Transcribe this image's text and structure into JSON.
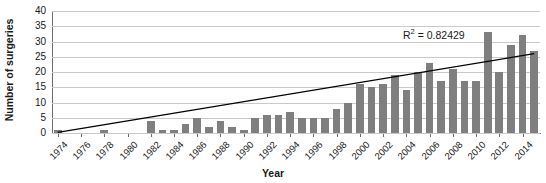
{
  "chart_data": {
    "type": "bar",
    "title": "",
    "xlabel": "Year",
    "ylabel": "Number of surgeries",
    "ylim": [
      0,
      40
    ],
    "ytick_values": [
      0,
      5,
      10,
      15,
      20,
      25,
      30,
      35,
      40
    ],
    "ytick_labels": [
      "0",
      "5",
      "10",
      "15",
      "20",
      "25",
      "30",
      "35",
      "40"
    ],
    "grid": true,
    "legend": "none",
    "bar_color": "#7f7f7f",
    "trendline": {
      "type": "linear",
      "color": "#000000",
      "annotation": "R² = 0.82429",
      "annotation_prefix": "R",
      "annotation_sup": "2",
      "annotation_suffix": " = 0.82429",
      "r_squared": 0.82429,
      "y_start": 0.2,
      "y_end": 26.0
    },
    "categories": [
      "1974",
      "1975",
      "1976",
      "1977",
      "1978",
      "1979",
      "1980",
      "1981",
      "1982",
      "1983",
      "1984",
      "1985",
      "1986",
      "1987",
      "1988",
      "1989",
      "1990",
      "1991",
      "1992",
      "1993",
      "1994",
      "1995",
      "1996",
      "1997",
      "1998",
      "1999",
      "2000",
      "2001",
      "2002",
      "2003",
      "2004",
      "2005",
      "2006",
      "2007",
      "2008",
      "2009",
      "2010",
      "2011",
      "2012",
      "2013",
      "2014",
      "2015"
    ],
    "xtick_labels": [
      "1974",
      "1976",
      "1978",
      "1980",
      "1982",
      "1984",
      "1986",
      "1988",
      "1990",
      "1992",
      "1994",
      "1996",
      "1998",
      "2000",
      "2002",
      "2004",
      "2006",
      "2008",
      "2010",
      "2012",
      "2014"
    ],
    "values": [
      1,
      0,
      0,
      0,
      1,
      0,
      0,
      0,
      4,
      1,
      1,
      3,
      5,
      2,
      4,
      2,
      1,
      5,
      6,
      6,
      7,
      5,
      5,
      5,
      8,
      10,
      16,
      15,
      16,
      19,
      14,
      20,
      23,
      17,
      21,
      17,
      17,
      33,
      20,
      29,
      32,
      27
    ]
  }
}
